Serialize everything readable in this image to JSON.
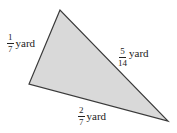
{
  "figure": {
    "shape": "triangle",
    "vertices": [
      [
        60,
        10
      ],
      [
        29,
        84
      ],
      [
        168,
        121
      ]
    ],
    "fill_color": "#d9d9d9",
    "stroke_color": "#3a3a3a"
  },
  "sides": {
    "left": {
      "numerator": "1",
      "denominator": "7",
      "unit": "yard"
    },
    "right": {
      "numerator": "5",
      "denominator": "14",
      "unit": "yard"
    },
    "bottom": {
      "numerator": "2",
      "denominator": "7",
      "unit": "yard"
    }
  }
}
